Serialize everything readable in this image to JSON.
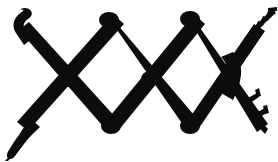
{
  "image": {
    "title": "Zigzag Lattice Glyph",
    "description": "Black brush-drawn zigzag lattice ornament forming two diamond cells between three X crossings, with knobbed apex nodes, a curled tail at the lower left, a hooked terminal at the upper left, and fringed comb-like barbs on both right-hand terminals.",
    "width": 278,
    "height": 162,
    "background_color": "#ffffff",
    "ink_color": "#0d0c0c",
    "style": "hand-inked silhouette, solid fill, no outline"
  },
  "geometry": {
    "crossings": [
      {
        "name": "left-crossing",
        "x": 68,
        "y": 79
      },
      {
        "name": "center-crossing",
        "x": 150,
        "y": 79
      },
      {
        "name": "right-crossing",
        "x": 228,
        "y": 76
      }
    ],
    "apex_nodes": [
      {
        "name": "top-left-apex",
        "x": 109,
        "y": 20
      },
      {
        "name": "top-right-apex",
        "x": 190,
        "y": 19
      },
      {
        "name": "bottom-left-apex",
        "x": 110,
        "y": 126
      },
      {
        "name": "bottom-right-apex",
        "x": 190,
        "y": 126
      }
    ],
    "terminals": [
      {
        "name": "upper-left-hook",
        "x": 22,
        "y": 13
      },
      {
        "name": "lower-left-curl",
        "x": 10,
        "y": 156
      },
      {
        "name": "upper-right-comb",
        "x": 268,
        "y": 10
      },
      {
        "name": "lower-right-barb",
        "x": 266,
        "y": 124
      }
    ],
    "stroke_width_avg": 13
  },
  "paths": {
    "main_lattice": "M 22 12 L 26 10 L 31 12 L 30 17 L 26 20 L 24 25 L 28 31 L 68 74 L 101 30 L 105 24 L 109 21 L 114 24 L 117 29 L 150 73 L 183 29 L 187 24 L 191 21 L 196 25 L 199 30 L 230 70 L 239 55 L 246 44 L 250 36 L 253 30 L 258 24 L 264 19 L 268 14 L 272 11 L 275 13 L 271 18 L 266 23 L 261 28 L 256 34 L 252 41 L 248 49 L 243 59 L 236 72 L 234 79 L 236 86 L 240 94 L 245 103 L 250 111 L 255 118 L 260 124 L 265 129 L 268 133 L 265 136 L 260 132 L 254 126 L 248 118 L 242 109 L 236 99 L 231 89 L 226 82 L 190 129 L 185 132 L 180 130 L 177 125 L 150 85 L 118 127 L 113 131 L 108 130 L 104 125 L 69 84 L 33 128 L 27 134 L 22 139 L 19 145 L 16 150 L 12 155 L 9 158 L 7 155 L 10 150 L 13 144 L 16 138 L 20 132 L 25 126 L 30 121 L 62 80 Z",
    "upper_right_prongs": [
      "M 256 18 L 259 14 L 261 20 L 258 24 Z",
      "M 261 15 L 264 11 L 266 17 L 263 21 Z",
      "M 266 12 L 269 8 L 271 14 L 268 18 Z"
    ],
    "lower_right_prongs": [
      "M 249 99 L 256 94 L 258 99 L 251 104 Z",
      "M 258 114 L 265 110 L 267 115 L 260 119 Z"
    ]
  },
  "nodes_visual": {
    "apex_cap_rx": 9,
    "apex_cap_ry": 7,
    "crossing_blob_r": 8
  },
  "labels": {
    "alt_text": "Black zigzag lattice ornament with two diamond openings",
    "caption": ""
  }
}
